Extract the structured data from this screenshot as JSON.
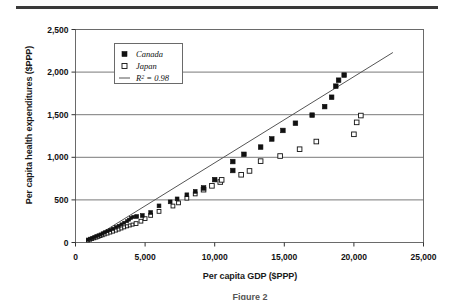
{
  "figure": {
    "caption": "Figure 2",
    "top_rule_color": "#3a3a3a"
  },
  "chart_data": {
    "type": "scatter",
    "title": "",
    "xlabel": "Per capita GDP ($PPP)",
    "ylabel": "Per capita health expenditures ($PPP)",
    "xlim": [
      0,
      25000
    ],
    "ylim": [
      0,
      2500
    ],
    "xticks": [
      0,
      5000,
      10000,
      15000,
      20000,
      25000
    ],
    "xtick_labels": [
      "0",
      "5,000",
      "10,000",
      "15,000",
      "20,000",
      "25,000"
    ],
    "yticks": [
      0,
      500,
      1000,
      1500,
      2000,
      2500
    ],
    "ytick_labels": [
      "0",
      "500",
      "1,000",
      "1,500",
      "2,000",
      "2,500"
    ],
    "grid": "horizontal",
    "legend_position": "upper-left-inside",
    "series": [
      {
        "name": "Canada",
        "marker": "filled-square",
        "color": "#111111",
        "points": [
          [
            900,
            35
          ],
          [
            1050,
            45
          ],
          [
            1200,
            55
          ],
          [
            1350,
            65
          ],
          [
            1500,
            75
          ],
          [
            1650,
            85
          ],
          [
            1800,
            95
          ],
          [
            1950,
            108
          ],
          [
            2100,
            120
          ],
          [
            2300,
            133
          ],
          [
            2500,
            148
          ],
          [
            2700,
            163
          ],
          [
            2900,
            180
          ],
          [
            3100,
            196
          ],
          [
            3300,
            213
          ],
          [
            3500,
            232
          ],
          [
            3700,
            250
          ],
          [
            3850,
            268
          ],
          [
            4000,
            288
          ],
          [
            4150,
            300
          ],
          [
            4400,
            305
          ],
          [
            4800,
            317
          ],
          [
            5400,
            352
          ],
          [
            6000,
            430
          ],
          [
            6800,
            477
          ],
          [
            7300,
            512
          ],
          [
            8000,
            560
          ],
          [
            8600,
            600
          ],
          [
            9200,
            640
          ],
          [
            10000,
            738
          ],
          [
            11300,
            845
          ],
          [
            11300,
            950
          ],
          [
            12100,
            1035
          ],
          [
            13300,
            1120
          ],
          [
            14100,
            1215
          ],
          [
            14900,
            1315
          ],
          [
            15800,
            1400
          ],
          [
            17000,
            1495
          ],
          [
            17900,
            1595
          ],
          [
            18400,
            1705
          ],
          [
            18700,
            1835
          ],
          [
            18900,
            1905
          ],
          [
            19300,
            1965
          ]
        ]
      },
      {
        "name": "Japan",
        "marker": "open-square",
        "color": "#111111",
        "points": [
          [
            900,
            25
          ],
          [
            1050,
            33
          ],
          [
            1200,
            42
          ],
          [
            1350,
            50
          ],
          [
            1500,
            58
          ],
          [
            1650,
            67
          ],
          [
            1800,
            76
          ],
          [
            1950,
            85
          ],
          [
            2100,
            95
          ],
          [
            2300,
            105
          ],
          [
            2500,
            117
          ],
          [
            2700,
            128
          ],
          [
            2900,
            140
          ],
          [
            3100,
            152
          ],
          [
            3300,
            165
          ],
          [
            3500,
            178
          ],
          [
            3700,
            190
          ],
          [
            3900,
            200
          ],
          [
            4100,
            210
          ],
          [
            4350,
            222
          ],
          [
            4700,
            250
          ],
          [
            5000,
            280
          ],
          [
            5400,
            318
          ],
          [
            6000,
            365
          ],
          [
            7000,
            428
          ],
          [
            7400,
            465
          ],
          [
            8000,
            520
          ],
          [
            8600,
            570
          ],
          [
            9200,
            620
          ],
          [
            9800,
            665
          ],
          [
            10400,
            710
          ],
          [
            10500,
            735
          ],
          [
            11900,
            795
          ],
          [
            12500,
            840
          ],
          [
            13300,
            955
          ],
          [
            14700,
            1015
          ],
          [
            16100,
            1095
          ],
          [
            17300,
            1185
          ],
          [
            20000,
            1270
          ],
          [
            20200,
            1410
          ],
          [
            20500,
            1490
          ]
        ]
      }
    ],
    "trendline": {
      "label": "R² = 0.98",
      "r_squared": 0.98,
      "color": "#555555",
      "start": [
        1200,
        45
      ],
      "end": [
        22800,
        2230
      ]
    },
    "legend_entries": [
      {
        "label": "Canada",
        "marker": "filled-square"
      },
      {
        "label": "Japan",
        "marker": "open-square"
      },
      {
        "label": "R² = 0.98",
        "marker": "line"
      }
    ]
  }
}
